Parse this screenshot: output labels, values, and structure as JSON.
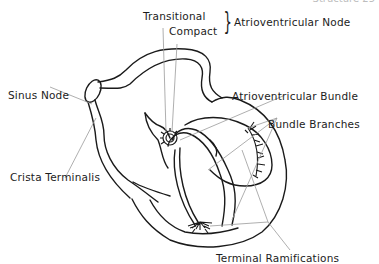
{
  "page_header": "Structure 25",
  "figure": {
    "labels": {
      "transitional": "Transitional",
      "compact": "Compact",
      "av_node": "Atrioventricular Node",
      "sinus_node": "Sinus Node",
      "crista_terminalis": "Crista Terminalis",
      "av_bundle": "Atrioventricular Bundle",
      "bundle_branches": "Bundle Branches",
      "terminal_ramifications": "Terminal Ramifications"
    },
    "brace_glyph": "}",
    "colors": {
      "line": "#1a1a1a",
      "leader": "#9a9a9a",
      "background": "#ffffff"
    }
  }
}
